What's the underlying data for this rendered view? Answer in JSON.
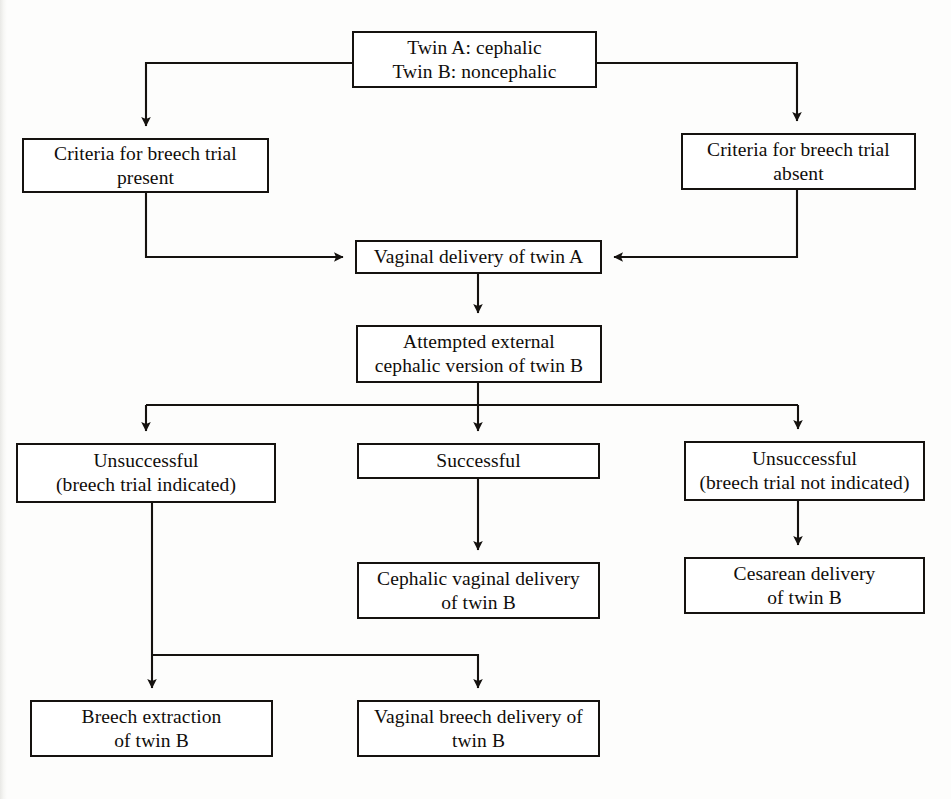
{
  "figure": {
    "type": "flowchart",
    "background_color": "#fdfdfc",
    "line_color": "#15120f",
    "box_border_color": "#15120f",
    "box_fill_color": "#ffffff"
  },
  "nodes": [
    {
      "id": "twin-presentation",
      "label": "Twin A: cephalic\nTwin B: noncephalic",
      "x": 352,
      "y": 31,
      "width": 245,
      "height": 57
    },
    {
      "id": "criteria-present",
      "label": "Criteria for breech trial\npresent",
      "x": 22,
      "y": 138,
      "width": 247,
      "height": 55
    },
    {
      "id": "criteria-absent",
      "label": "Criteria for breech trial\nabsent",
      "x": 681,
      "y": 133,
      "width": 235,
      "height": 57
    },
    {
      "id": "vaginal-delivery-twin-a",
      "label": "Vaginal delivery of twin A",
      "x": 355,
      "y": 240,
      "width": 247,
      "height": 34
    },
    {
      "id": "external-cephalic-version",
      "label": "Attempted external\ncephalic version of twin B",
      "x": 356,
      "y": 325,
      "width": 246,
      "height": 58
    },
    {
      "id": "unsuccessful-breech-indicated",
      "label": "Unsuccessful\n(breech trial indicated)",
      "x": 16,
      "y": 443,
      "width": 260,
      "height": 60
    },
    {
      "id": "successful",
      "label": "Successful",
      "x": 357,
      "y": 443,
      "width": 243,
      "height": 36
    },
    {
      "id": "unsuccessful-breech-not-indicated",
      "label": "Unsuccessful\n(breech trial not indicated)",
      "x": 684,
      "y": 441,
      "width": 241,
      "height": 60
    },
    {
      "id": "cephalic-vaginal-delivery-twin-b",
      "label": "Cephalic vaginal delivery\nof twin B",
      "x": 357,
      "y": 562,
      "width": 243,
      "height": 57
    },
    {
      "id": "cesarean-delivery-twin-b",
      "label": "Cesarean delivery\nof twin B",
      "x": 684,
      "y": 557,
      "width": 241,
      "height": 57
    },
    {
      "id": "breech-extraction-twin-b",
      "label": "Breech extraction\nof twin B",
      "x": 30,
      "y": 700,
      "width": 243,
      "height": 57
    },
    {
      "id": "vaginal-breech-delivery-twin-b",
      "label": "Vaginal breech delivery of\ntwin B",
      "x": 357,
      "y": 700,
      "width": 243,
      "height": 57
    }
  ],
  "connectors": [
    {
      "id": "presentation-to-criteria-present",
      "from": "twin-presentation",
      "to": "criteria-present",
      "arrow": true
    },
    {
      "id": "presentation-to-criteria-absent",
      "from": "twin-presentation",
      "to": "criteria-absent",
      "arrow": true
    },
    {
      "id": "criteria-present-to-vaginal",
      "from": "criteria-present",
      "to": "vaginal-delivery-twin-a",
      "arrow": true
    },
    {
      "id": "criteria-absent-to-vaginal",
      "from": "criteria-absent",
      "to": "vaginal-delivery-twin-a",
      "arrow": true
    },
    {
      "id": "vaginal-to-version",
      "from": "vaginal-delivery-twin-a",
      "to": "external-cephalic-version",
      "arrow": true
    },
    {
      "id": "version-to-unsuccessful-indicated",
      "from": "external-cephalic-version",
      "to": "unsuccessful-breech-indicated",
      "arrow": true
    },
    {
      "id": "version-to-successful",
      "from": "external-cephalic-version",
      "to": "successful",
      "arrow": true
    },
    {
      "id": "version-to-unsuccessful-not-indicated",
      "from": "external-cephalic-version",
      "to": "unsuccessful-breech-not-indicated",
      "arrow": true
    },
    {
      "id": "successful-to-cephalic-vaginal",
      "from": "successful",
      "to": "cephalic-vaginal-delivery-twin-b",
      "arrow": true
    },
    {
      "id": "unsuccessful-not-indicated-to-cesarean",
      "from": "unsuccessful-breech-not-indicated",
      "to": "cesarean-delivery-twin-b",
      "arrow": true
    },
    {
      "id": "unsuccessful-indicated-to-breech-extraction",
      "from": "unsuccessful-breech-indicated",
      "to": "breech-extraction-twin-b",
      "arrow": true
    },
    {
      "id": "unsuccessful-indicated-to-vaginal-breech",
      "from": "unsuccessful-breech-indicated",
      "to": "vaginal-breech-delivery-twin-b",
      "arrow": true
    }
  ]
}
